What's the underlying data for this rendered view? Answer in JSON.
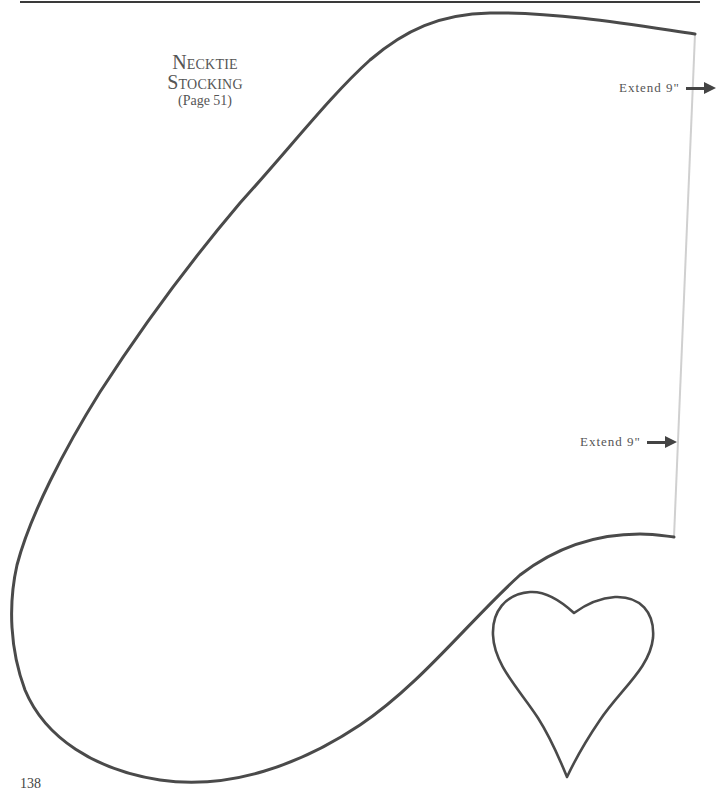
{
  "page": {
    "title_line1": "Necktie",
    "title_line2": "Stocking",
    "page_reference": "(Page 51)",
    "page_number": "138"
  },
  "annotations": {
    "extend_top": "Extend 9\"",
    "extend_bottom": "Extend 9\""
  },
  "pattern_pieces": [
    {
      "name": "stocking-outline",
      "stroke": "#4a4a4a"
    },
    {
      "name": "heart-outline",
      "stroke": "#4a4a4a"
    },
    {
      "name": "extension-guide-line",
      "stroke": "#d0d0d0"
    }
  ],
  "colors": {
    "line": "#4a4a4a",
    "guide": "#d0d0d0",
    "text": "#555555",
    "background": "#ffffff"
  }
}
